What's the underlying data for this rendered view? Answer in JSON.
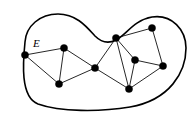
{
  "figure": {
    "label_E": "E",
    "label_E_position": {
      "x": 33,
      "y": 47
    },
    "colors": {
      "boundary": "#000000",
      "edge": "#000000",
      "vertex": "#000000",
      "background": "#ffffff"
    },
    "boundary": {
      "name": "region-outline",
      "type": "closed-smooth-curve",
      "path": "M 25,42 C 26,26 40,14 58,14 C 76,14 86,26 95,36 C 101,42 108,44 116,40 C 126,35 134,20 152,17 C 172,14 186,30 186,48 C 186,72 170,100 130,107 C 100,112 60,112 38,104 C 20,97 23,62 25,42 Z"
    },
    "vertices": [
      {
        "id": "v1",
        "name": "vertex-left",
        "x": 25,
        "y": 55,
        "r": 3.6
      },
      {
        "id": "v2",
        "name": "vertex-upper-left",
        "x": 64,
        "y": 48,
        "r": 3.6
      },
      {
        "id": "v3",
        "name": "vertex-lower-left",
        "x": 59,
        "y": 84,
        "r": 3.6
      },
      {
        "id": "v4",
        "name": "vertex-center",
        "x": 95,
        "y": 68,
        "r": 3.6
      },
      {
        "id": "v5",
        "name": "vertex-upper-mid",
        "x": 116,
        "y": 38,
        "r": 3.6
      },
      {
        "id": "v6",
        "name": "vertex-top-right",
        "x": 152,
        "y": 28,
        "r": 3.6
      },
      {
        "id": "v7",
        "name": "vertex-inner-right",
        "x": 135,
        "y": 60,
        "r": 3.6
      },
      {
        "id": "v8",
        "name": "vertex-far-right",
        "x": 163,
        "y": 66,
        "r": 3.6
      },
      {
        "id": "v9",
        "name": "vertex-bottom-right",
        "x": 129,
        "y": 89,
        "r": 3.6
      }
    ],
    "edges": [
      {
        "id": "e1",
        "name": "edge-E",
        "from": "v1",
        "to": "v2",
        "labeled": "E"
      },
      {
        "id": "e2",
        "name": "edge-left-lowerleft",
        "from": "v1",
        "to": "v3"
      },
      {
        "id": "e3",
        "name": "edge-upperleft-lowerleft",
        "from": "v2",
        "to": "v3"
      },
      {
        "id": "e4",
        "name": "edge-upperleft-center",
        "from": "v2",
        "to": "v4"
      },
      {
        "id": "e5",
        "name": "edge-lowerleft-center",
        "from": "v3",
        "to": "v4"
      },
      {
        "id": "e6",
        "name": "edge-center-uppermid",
        "from": "v4",
        "to": "v5"
      },
      {
        "id": "e7",
        "name": "edge-center-bottomright",
        "from": "v4",
        "to": "v9"
      },
      {
        "id": "e8",
        "name": "edge-uppermid-topright",
        "from": "v5",
        "to": "v6"
      },
      {
        "id": "e9",
        "name": "edge-uppermid-innerright",
        "from": "v5",
        "to": "v7"
      },
      {
        "id": "e10",
        "name": "edge-uppermid-bottomright",
        "from": "v5",
        "to": "v9"
      },
      {
        "id": "e11",
        "name": "edge-topright-farright",
        "from": "v6",
        "to": "v8"
      },
      {
        "id": "e12",
        "name": "edge-innerright-farright",
        "from": "v7",
        "to": "v8"
      },
      {
        "id": "e13",
        "name": "edge-innerright-bottomright",
        "from": "v7",
        "to": "v9"
      },
      {
        "id": "e14",
        "name": "edge-bottomright-farright",
        "from": "v9",
        "to": "v8"
      }
    ]
  }
}
